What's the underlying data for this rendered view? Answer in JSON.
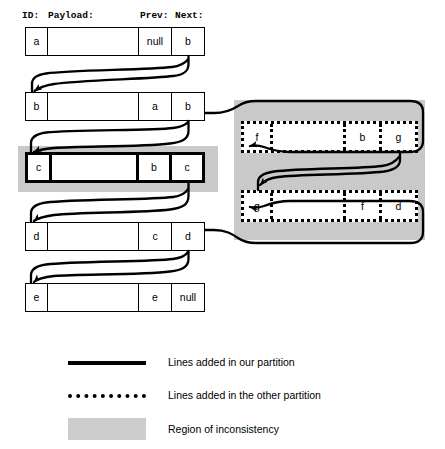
{
  "diagram": {
    "column_headers": [
      {
        "key": "id",
        "label": "ID:",
        "x": 22,
        "y": 10
      },
      {
        "key": "payload",
        "label": "Payload:",
        "x": 48,
        "y": 10
      },
      {
        "key": "prev",
        "label": "Prev:",
        "x": 140,
        "y": 10
      },
      {
        "key": "next",
        "label": "Next:",
        "x": 175,
        "y": 10
      }
    ],
    "left_nodes": [
      {
        "id": "a",
        "payload": "",
        "prev": "null",
        "next": "b",
        "style": "thin",
        "x": 25,
        "y": 27,
        "w": 180,
        "h": 29
      },
      {
        "id": "b",
        "payload": "",
        "prev": "a",
        "next": "b",
        "style": "thin",
        "x": 25,
        "y": 92,
        "w": 180,
        "h": 29
      },
      {
        "id": "c",
        "payload": "",
        "prev": "b",
        "next": "c",
        "style": "bold",
        "x": 25,
        "y": 152,
        "w": 180,
        "h": 31
      },
      {
        "id": "d",
        "payload": "",
        "prev": "c",
        "next": "d",
        "style": "thin",
        "x": 25,
        "y": 222,
        "w": 180,
        "h": 29
      },
      {
        "id": "e",
        "payload": "",
        "prev": "e",
        "next": "null",
        "style": "thin",
        "x": 25,
        "y": 283,
        "w": 180,
        "h": 29
      }
    ],
    "right_nodes": [
      {
        "id": "f",
        "payload": "",
        "prev": "b",
        "next": "g",
        "style": "dotted",
        "x": 241,
        "y": 121,
        "w": 177,
        "h": 32
      },
      {
        "id": "g",
        "payload": "",
        "prev": "f",
        "next": "d",
        "style": "dotted",
        "x": 241,
        "y": 190,
        "w": 177,
        "h": 32
      }
    ],
    "regions": [
      {
        "name": "left-region",
        "x": 18,
        "y": 146,
        "w": 200,
        "h": 46
      },
      {
        "name": "right-region",
        "x": 234,
        "y": 100,
        "w": 191,
        "h": 140
      }
    ],
    "legend": [
      {
        "key": "our-partition",
        "marker": "solid-line",
        "label": "Lines added in our partition",
        "swatch": {
          "x": 68,
          "y": 361,
          "w": 78,
          "h": 4
        },
        "label_x": 168,
        "label_y": 356
      },
      {
        "key": "other-partition",
        "marker": "dotted-line",
        "label": "Lines added in the other partition",
        "swatch": {
          "x": 68,
          "y": 394,
          "w": 78,
          "h": 4
        },
        "label_x": 168,
        "label_y": 389
      },
      {
        "key": "inconsistency",
        "marker": "region",
        "label": "Region of inconsistency",
        "swatch": {
          "x": 68,
          "y": 418,
          "w": 78,
          "h": 22
        },
        "label_x": 168,
        "label_y": 423
      }
    ]
  }
}
